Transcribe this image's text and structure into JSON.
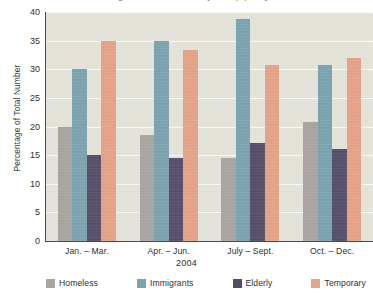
{
  "chart_data": {
    "type": "bar",
    "title": "Percentage of Total Number by Group per Quarter",
    "xlabel": "2004",
    "ylabel": "Percentage of Total Number",
    "categories": [
      "Jan. – Mar.",
      "Apr. – Jun.",
      "July – Sept.",
      "Oct. – Dec."
    ],
    "series": [
      {
        "name": "Homeless",
        "color": "#a9a5a1",
        "values": [
          20.0,
          18.5,
          14.5,
          20.8
        ]
      },
      {
        "name": "Immigrants",
        "color": "#7ba3b0",
        "values": [
          30.0,
          35.0,
          38.8,
          30.8
        ]
      },
      {
        "name": "Elderly",
        "color": "#554d68",
        "values": [
          15.0,
          14.5,
          17.2,
          16.0
        ]
      },
      {
        "name": "Temporary",
        "color": "#e8a385",
        "values": [
          35.0,
          33.4,
          30.8,
          32.0
        ]
      }
    ],
    "ylim": [
      0,
      40
    ],
    "yticks": [
      0,
      5,
      10,
      15,
      20,
      25,
      30,
      35,
      40
    ],
    "ytick_labels": [
      "0",
      "5",
      "10",
      "15",
      "20",
      "25",
      "30",
      "35",
      "40"
    ],
    "grid": "horizontal",
    "legend_position": "bottom",
    "plot_background": "#e4e4db",
    "gridline_color": "#fbfbf7",
    "axis_color": "#4a4a4a"
  }
}
